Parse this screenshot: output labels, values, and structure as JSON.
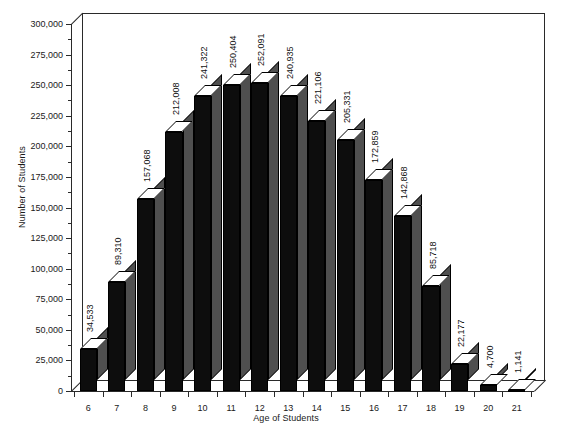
{
  "chart_data": {
    "type": "bar",
    "title": "",
    "xlabel": "Age of Students",
    "ylabel": "Number of Students",
    "categories": [
      "6",
      "7",
      "8",
      "9",
      "10",
      "11",
      "12",
      "13",
      "14",
      "15",
      "16",
      "17",
      "18",
      "19",
      "20",
      "21"
    ],
    "values": [
      34533,
      89310,
      157068,
      212008,
      241322,
      250404,
      252091,
      240935,
      221106,
      205331,
      172859,
      142868,
      85718,
      22177,
      4700,
      1141
    ],
    "value_labels": [
      "34,533",
      "89,310",
      "157,068",
      "212,008",
      "241,322",
      "250,404",
      "252,091",
      "240,935",
      "221,106",
      "205,331",
      "172,859",
      "142,868",
      "85,718",
      "22,177",
      "4,700",
      "1,141"
    ],
    "ylim": [
      0,
      300000
    ],
    "ytick_step": 25000,
    "yminor_step": 12500,
    "ytick_labels": [
      "0",
      "25,000",
      "50,000",
      "75,000",
      "100,000",
      "125,000",
      "150,000",
      "175,000",
      "200,000",
      "225,000",
      "250,000",
      "275,000",
      "300,000"
    ],
    "ytick_values": [
      0,
      25000,
      50000,
      75000,
      100000,
      125000,
      150000,
      175000,
      200000,
      225000,
      250000,
      275000,
      300000
    ],
    "grid": false,
    "legend": false,
    "style": "3d-column",
    "colors": {
      "bar_front": "#0d0d0d",
      "bar_side": "#4f4f4f",
      "bar_top": "#ffffff",
      "axis": "#2a2a2a",
      "text": "#1a1a1a",
      "background": "#ffffff"
    }
  }
}
